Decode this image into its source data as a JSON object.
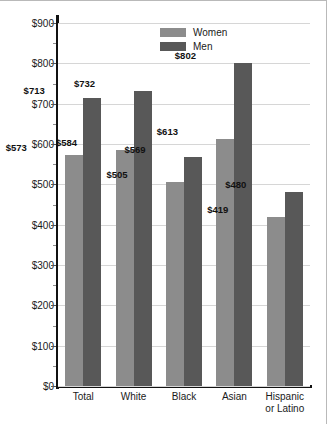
{
  "chart_data": {
    "type": "bar",
    "title": "",
    "xlabel": "",
    "ylabel": "Earnings",
    "ylim": [
      0,
      900
    ],
    "ytick_step": 100,
    "minor_tick_step": 50,
    "grid": true,
    "legend_position": "top-center",
    "categories": [
      "Total",
      "White",
      "Black",
      "Asian",
      "Hispanic or Latino"
    ],
    "category_lines": [
      [
        "Total"
      ],
      [
        "White"
      ],
      [
        "Black"
      ],
      [
        "Asian"
      ],
      [
        "Hispanic",
        "or Latino"
      ]
    ],
    "series": [
      {
        "name": "Women",
        "color": "#8c8c8c",
        "values": [
          573,
          584,
          505,
          613,
          419
        ],
        "labels": [
          "$573",
          "$584",
          "$505",
          "$613",
          "$419"
        ]
      },
      {
        "name": "Men",
        "color": "#585858",
        "values": [
          713,
          732,
          569,
          802,
          480
        ],
        "labels": [
          "$713",
          "$732",
          "$569",
          "$802",
          "$480"
        ]
      }
    ],
    "ytick_labels": [
      "$900",
      "$800",
      "$700",
      "$600",
      "$500",
      "$400",
      "$300",
      "$200",
      "$100",
      "$0"
    ],
    "ytick_values": [
      900,
      800,
      700,
      600,
      500,
      400,
      300,
      200,
      100,
      0
    ]
  },
  "legend": {
    "items": [
      {
        "label": "Women",
        "color": "#8c8c8c"
      },
      {
        "label": "Men",
        "color": "#585858"
      }
    ]
  },
  "axis": {
    "y_title": "Earnings"
  }
}
